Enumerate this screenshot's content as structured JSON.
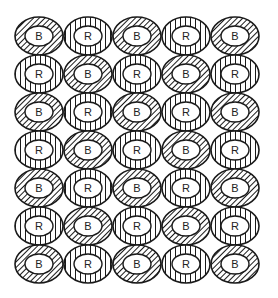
{
  "diagram": {
    "rows": 7,
    "cols": 5,
    "grid": [
      [
        "B",
        "R",
        "B",
        "R",
        "B"
      ],
      [
        "R",
        "B",
        "R",
        "B",
        "R"
      ],
      [
        "B",
        "R",
        "B",
        "R",
        "B"
      ],
      [
        "R",
        "B",
        "R",
        "B",
        "R"
      ],
      [
        "B",
        "R",
        "B",
        "R",
        "B"
      ],
      [
        "R",
        "B",
        "R",
        "B",
        "R"
      ],
      [
        "B",
        "R",
        "B",
        "R",
        "B"
      ]
    ],
    "legend": {
      "B": "diagonal-hatch",
      "R": "vertical-hatch"
    },
    "colors": {
      "stroke": "#1a1a1a",
      "background": "#ffffff"
    }
  }
}
